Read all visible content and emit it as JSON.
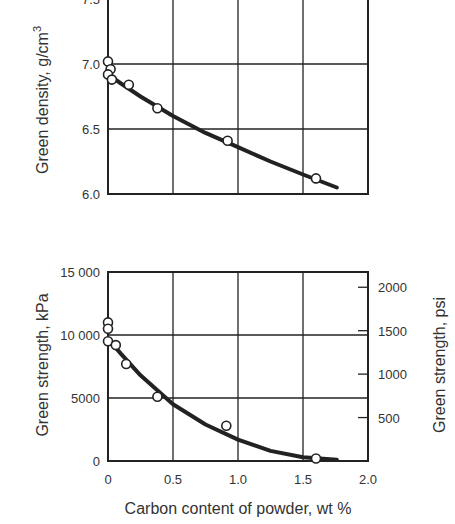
{
  "chart_data": [
    {
      "type": "scatter",
      "title": "",
      "xlabel": "",
      "ylabel": "Green density, g/cm³",
      "ylabel_text": "Green density, g/cm",
      "ylabel_sup": "3",
      "xlim": [
        0,
        2.0
      ],
      "ylim": [
        6.0,
        7.5
      ],
      "grid": true,
      "yticks": [
        "7.5",
        "7.0",
        "6.5",
        "6.0"
      ],
      "points": [
        {
          "x": 0.0,
          "y": 7.02
        },
        {
          "x": 0.02,
          "y": 6.96
        },
        {
          "x": 0.0,
          "y": 6.92
        },
        {
          "x": 0.03,
          "y": 6.88
        },
        {
          "x": 0.16,
          "y": 6.84
        },
        {
          "x": 0.38,
          "y": 6.66
        },
        {
          "x": 0.92,
          "y": 6.41
        },
        {
          "x": 1.6,
          "y": 6.12
        }
      ],
      "fit_curve": [
        {
          "x": 0.0,
          "y": 6.92
        },
        {
          "x": 0.1,
          "y": 6.85
        },
        {
          "x": 0.25,
          "y": 6.75
        },
        {
          "x": 0.5,
          "y": 6.6
        },
        {
          "x": 0.75,
          "y": 6.47
        },
        {
          "x": 1.0,
          "y": 6.36
        },
        {
          "x": 1.25,
          "y": 6.25
        },
        {
          "x": 1.5,
          "y": 6.15
        },
        {
          "x": 1.76,
          "y": 6.05
        }
      ]
    },
    {
      "type": "scatter",
      "title": "",
      "xlabel": "Carbon content of powder, wt %",
      "ylabel": "Green strength, kPa",
      "ylabel_right": "Green strength, psi",
      "xlim": [
        0,
        2.0
      ],
      "ylim": [
        0,
        15000
      ],
      "ylim_right_psi": [
        0,
        2175
      ],
      "grid": true,
      "xticks": [
        "0",
        "0.5",
        "1.0",
        "1.5",
        "2.0"
      ],
      "yticks": [
        "15 000",
        "10 000",
        "5000",
        "0"
      ],
      "yticks_right": [
        "2000",
        "1500",
        "1000",
        "500"
      ],
      "points": [
        {
          "x": 0.0,
          "y": 11000
        },
        {
          "x": 0.0,
          "y": 10500
        },
        {
          "x": 0.0,
          "y": 9500
        },
        {
          "x": 0.06,
          "y": 9200
        },
        {
          "x": 0.14,
          "y": 7700
        },
        {
          "x": 0.38,
          "y": 5100
        },
        {
          "x": 0.91,
          "y": 2800
        },
        {
          "x": 1.6,
          "y": 200
        }
      ],
      "fit_curve": [
        {
          "x": 0.0,
          "y": 9700
        },
        {
          "x": 0.1,
          "y": 8500
        },
        {
          "x": 0.25,
          "y": 6800
        },
        {
          "x": 0.5,
          "y": 4500
        },
        {
          "x": 0.75,
          "y": 2900
        },
        {
          "x": 1.0,
          "y": 1700
        },
        {
          "x": 1.25,
          "y": 800
        },
        {
          "x": 1.5,
          "y": 300
        },
        {
          "x": 1.76,
          "y": 100
        }
      ]
    }
  ]
}
